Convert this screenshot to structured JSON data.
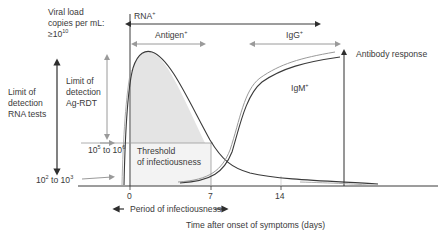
{
  "y_axis": {
    "title_line1": "Viral load",
    "title_line2": "copies per mL:",
    "title_line3_base": "≥10",
    "title_line3_exp": "10"
  },
  "limits": {
    "rna_tests_line1": "Limit of",
    "rna_tests_line2": "detection",
    "rna_tests_line3": "RNA tests",
    "ag_rdt_line1": "Limit of",
    "ag_rdt_line2": "detection",
    "ag_rdt_line3": "Ag-RDT"
  },
  "levels": {
    "upper_base1": "10",
    "upper_exp1": "5",
    "upper_mid": " to 10",
    "upper_exp2": "6",
    "lower_base1": "10",
    "lower_exp1": "2",
    "lower_mid": " to 10",
    "lower_exp2": "3"
  },
  "threshold": {
    "line1": "Threshold",
    "line2": "of infectiousness"
  },
  "detection_windows": {
    "rna": "RNA",
    "rna_sup": "+",
    "antigen": "Antigen",
    "antigen_sup": "+",
    "igg": "IgG",
    "igg_sup": "+",
    "igm": "IgM",
    "igm_sup": "+"
  },
  "right_axis": {
    "title": "Antibody response"
  },
  "x_axis": {
    "ticks": [
      "0",
      "7",
      "14"
    ],
    "title": "Time after onset of symptoms (days)"
  },
  "period": {
    "label": "Period of infectiousness"
  },
  "colors": {
    "dark_line": "#3a3a3a",
    "grey_line": "#9a9a9a",
    "shade_fill": "#e4e4e4",
    "background": "#ffffff"
  }
}
